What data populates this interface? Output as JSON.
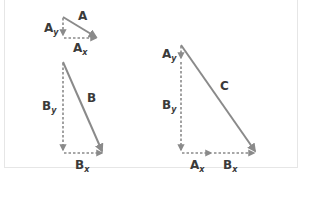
{
  "colors": {
    "vector": "#8a8a8a",
    "label": "#3a3a3a",
    "frame_border": "#e6e6e6",
    "background": "#ffffff"
  },
  "left_panel": {
    "vector_a": {
      "label": "A",
      "tail": [
        63,
        17
      ],
      "head": [
        98,
        38
      ]
    },
    "a_y": {
      "label": "A",
      "subscript": "y"
    },
    "a_x": {
      "label": "A",
      "subscript": "x"
    },
    "vector_b": {
      "label": "B",
      "tail": [
        63,
        62
      ],
      "head": [
        103,
        153
      ]
    },
    "b_y": {
      "label": "B",
      "subscript": "y"
    },
    "b_x": {
      "label": "B",
      "subscript": "x"
    }
  },
  "right_panel": {
    "vector_c": {
      "label": "C",
      "tail": [
        181,
        45
      ],
      "head": [
        256,
        153
      ]
    },
    "a_y": {
      "label": "A",
      "subscript": "y"
    },
    "b_y": {
      "label": "B",
      "subscript": "y"
    },
    "a_x": {
      "label": "A",
      "subscript": "x"
    },
    "b_x": {
      "label": "B",
      "subscript": "x"
    }
  }
}
